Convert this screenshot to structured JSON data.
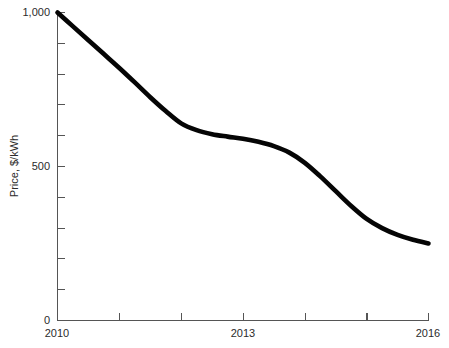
{
  "chart_data": {
    "type": "line",
    "title": "",
    "subtitle": "",
    "xlabel": "",
    "ylabel": "Price, $/kWh",
    "xlim": [
      2010,
      2016
    ],
    "ylim": [
      0,
      1000
    ],
    "grid": false,
    "legend": false,
    "legend_position": "none",
    "x_tick_values": [
      2010,
      2011,
      2012,
      2013,
      2014,
      2015,
      2016
    ],
    "x_tick_labels": [
      "2010",
      "",
      "",
      "2013",
      "",
      "",
      "2016"
    ],
    "x_labeled_ticks": [
      "2010",
      "2013",
      "2016"
    ],
    "y_tick_values": [
      0,
      100,
      200,
      300,
      400,
      500,
      600,
      700,
      800,
      900,
      1000
    ],
    "y_tick_labels": [
      "0",
      "",
      "",
      "",
      "",
      "500",
      "",
      "",
      "",
      "",
      "1,000"
    ],
    "y_labeled_ticks": [
      "0",
      "500",
      "1,000"
    ],
    "y_minor_tick_interval": 100,
    "series": [
      {
        "name": "Price, $/kWh",
        "color": "#050505",
        "line_width": 4.6,
        "x": [
          2010.0,
          2010.25,
          2010.5,
          2010.75,
          2011.0,
          2011.25,
          2011.5,
          2011.75,
          2012.0,
          2012.25,
          2012.5,
          2012.75,
          2013.0,
          2013.25,
          2013.5,
          2013.75,
          2014.0,
          2014.25,
          2014.5,
          2014.75,
          2015.0,
          2015.25,
          2015.5,
          2015.75,
          2016.0
        ],
        "values": [
          1000,
          955,
          910,
          865,
          820,
          773,
          725,
          680,
          640,
          618,
          605,
          597,
          590,
          580,
          566,
          545,
          512,
          468,
          420,
          372,
          330,
          300,
          278,
          262,
          250
        ]
      }
    ],
    "annotations": [],
    "key_points": [
      {
        "x": 2010,
        "y": 1000,
        "note": "start of series at axis maximum"
      },
      {
        "x": 2012,
        "y": 640,
        "note": "slope flattens into plateau"
      },
      {
        "x": 2013,
        "y": 590,
        "note": "plateau mid-point"
      },
      {
        "x": 2015,
        "y": 330,
        "note": "end of steep S-shaped drop"
      },
      {
        "x": 2016,
        "y": 250,
        "note": "final value"
      }
    ]
  },
  "axes": {
    "y_title": "Price, $/kWh",
    "y_labels": {
      "top": "1,000",
      "middle": "500",
      "bottom": "0"
    },
    "x_labels": {
      "start": "2010",
      "middle": "2013",
      "end": "2016"
    }
  }
}
